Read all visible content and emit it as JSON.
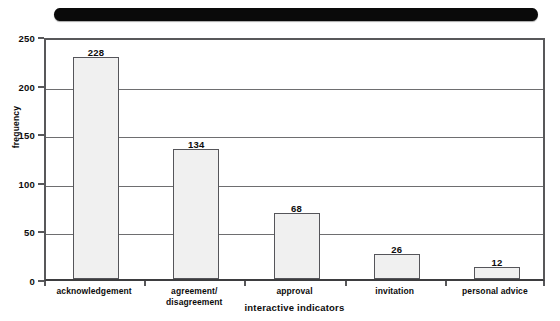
{
  "figure": {
    "redaction_bar": {
      "name": "redacted-title-bar",
      "color": "#0a0a0a",
      "text": ""
    },
    "background_color": "#ffffff",
    "axis_color": "#58585a",
    "bar_fill_color": "#f0f0f0",
    "bar_edge_color": "#55555a"
  },
  "chart_data": {
    "type": "bar",
    "title": "",
    "subtitle": "",
    "xlabel": "interactive indicators",
    "ylabel": "frequency",
    "categories": [
      "acknowledgement",
      "agreement/ disagreement",
      "approval",
      "invitation",
      "personal advice"
    ],
    "category_lines": [
      [
        "acknowledgement"
      ],
      [
        "agreement/",
        "disagreement"
      ],
      [
        "approval"
      ],
      [
        "invitation"
      ],
      [
        "personal advice"
      ]
    ],
    "values": [
      228,
      134,
      68,
      26,
      12
    ],
    "data_labels": [
      "228",
      "134",
      "68",
      "26",
      "12"
    ],
    "ylim": [
      0,
      250
    ],
    "ytick_values": [
      0,
      50,
      100,
      150,
      200,
      250
    ],
    "ytick_labels": [
      "0",
      "50",
      "100",
      "150",
      "200",
      "250"
    ],
    "grid": true,
    "grid_axis": "y",
    "legend": false,
    "legend_position": "none"
  }
}
